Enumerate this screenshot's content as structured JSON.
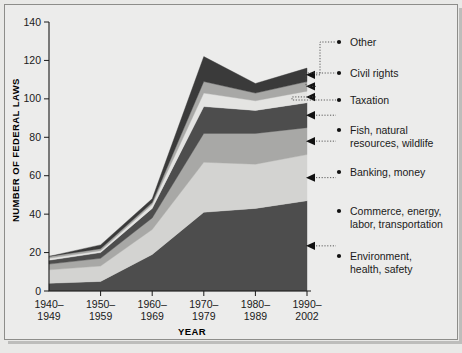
{
  "chart_data": {
    "type": "area",
    "title": "",
    "xlabel": "YEAR",
    "ylabel": "NUMBER OF FEDERAL LAWS",
    "ylim": [
      0,
      140
    ],
    "yticks": [
      0,
      20,
      40,
      60,
      80,
      100,
      120,
      140
    ],
    "ytick_labels": [
      "0",
      "20",
      "40",
      "60",
      "80",
      "100",
      "120",
      "140"
    ],
    "grid": false,
    "legend_position": "right",
    "stacked": true,
    "categories": [
      "1940–\n1949",
      "1950–\n1959",
      "1960–\n1969",
      "1970–\n1979",
      "1980–\n1989",
      "1990–\n2002"
    ],
    "category_lines": [
      [
        "1940–",
        "1949"
      ],
      [
        "1950–",
        "1959"
      ],
      [
        "1960–",
        "1969"
      ],
      [
        "1970–",
        "1979"
      ],
      [
        "1980–",
        "1989"
      ],
      [
        "1990–",
        "2002"
      ]
    ],
    "series": [
      {
        "name": "Environment, health, safety",
        "label_lines": [
          "Environment,",
          "health, safety"
        ],
        "color": "#4d4d4d",
        "values": [
          4,
          5,
          19,
          41,
          43,
          47
        ]
      },
      {
        "name": "Commerce, energy, labor, transportation",
        "label_lines": [
          "Commerce, energy,",
          "labor, transportation"
        ],
        "color": "#d3d3d1",
        "values": [
          7,
          8,
          13,
          26,
          23,
          24
        ]
      },
      {
        "name": "Banking, money",
        "label_lines": [
          "Banking, money"
        ],
        "color": "#a8a8a6",
        "values": [
          3,
          4,
          6,
          15,
          16,
          14
        ]
      },
      {
        "name": "Fish, natural resources, wildlife",
        "label_lines": [
          "Fish, natural",
          "resources, wildlife"
        ],
        "color": "#4d4d4d",
        "values": [
          2,
          3,
          5,
          14,
          12,
          13
        ]
      },
      {
        "name": "Taxation",
        "label_lines": [
          "Taxation"
        ],
        "color": "#e4e4e2",
        "values": [
          1,
          1,
          2,
          7,
          5,
          6
        ]
      },
      {
        "name": "Civil rights",
        "label_lines": [
          "Civil rights"
        ],
        "color": "#a8a8a6",
        "values": [
          1,
          1,
          1,
          6,
          4,
          5
        ]
      },
      {
        "name": "Other",
        "label_lines": [
          "Other"
        ],
        "color": "#3a3a3a",
        "values": [
          0,
          2,
          2,
          13,
          5,
          7
        ]
      }
    ],
    "totals": [
      18,
      24,
      48,
      122,
      108,
      116
    ]
  },
  "legend": {
    "items": [
      {
        "id": "other",
        "lines": [
          "Other"
        ]
      },
      {
        "id": "civil-rights",
        "lines": [
          "Civil rights"
        ]
      },
      {
        "id": "taxation",
        "lines": [
          "Taxation"
        ]
      },
      {
        "id": "fish-natural-resources-wildlife",
        "lines": [
          "Fish, natural",
          "resources, wildlife"
        ]
      },
      {
        "id": "banking-money",
        "lines": [
          "Banking, money"
        ]
      },
      {
        "id": "commerce-energy-labor-transportation",
        "lines": [
          "Commerce, energy,",
          "labor, transportation"
        ]
      },
      {
        "id": "environment-health-safety",
        "lines": [
          "Environment,",
          "health, safety"
        ]
      }
    ]
  },
  "axes": {
    "y_title": "NUMBER OF FEDERAL LAWS",
    "x_title": "YEAR",
    "y_ticks": [
      "140",
      "120",
      "100",
      "80",
      "60",
      "40",
      "20",
      "0"
    ],
    "x_ticks_top": [
      "1940–",
      "1950–",
      "1960–",
      "1970–",
      "1980–",
      "1990–"
    ],
    "x_ticks_bottom": [
      "1949",
      "1959",
      "1969",
      "1979",
      "1989",
      "2002"
    ]
  }
}
